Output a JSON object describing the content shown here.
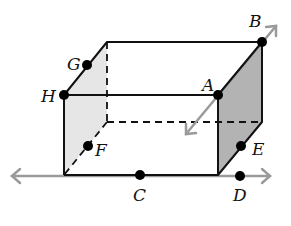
{
  "diagram": {
    "type": "rectangular prism with lines",
    "colors": {
      "edge": "#111111",
      "line": "#9a9a9a",
      "left_face": "#e6e6e6",
      "right_face": "#b3b3b3",
      "point": "#000000"
    },
    "points": [
      {
        "label": "A",
        "x": 218,
        "y": 95,
        "lx": 202,
        "ly": 90
      },
      {
        "label": "B",
        "x": 262,
        "y": 42,
        "lx": 248,
        "ly": 26
      },
      {
        "label": "C",
        "x": 140,
        "y": 175,
        "lx": 133,
        "ly": 200
      },
      {
        "label": "D",
        "x": 240,
        "y": 176,
        "lx": 233,
        "ly": 200
      },
      {
        "label": "E",
        "x": 241,
        "y": 146,
        "lx": 252,
        "ly": 154
      },
      {
        "label": "F",
        "x": 88,
        "y": 146,
        "lx": 95,
        "ly": 156
      },
      {
        "label": "G",
        "x": 87,
        "y": 65,
        "lx": 67,
        "ly": 68
      },
      {
        "label": "H",
        "x": 64,
        "y": 95,
        "lx": 42,
        "ly": 102
      }
    ],
    "lines": [
      {
        "name": "line-CD",
        "through": [
          "C",
          "D"
        ]
      },
      {
        "name": "line-AB",
        "through": [
          "A",
          "B"
        ]
      }
    ]
  }
}
